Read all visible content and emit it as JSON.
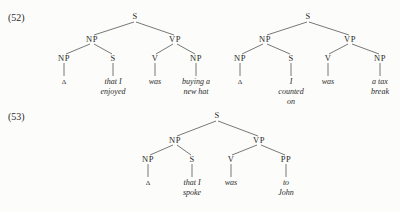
{
  "examples": [
    {
      "number": "(52)",
      "trees": [
        {
          "root": "S",
          "np": "NP",
          "vp": "VP",
          "np_child": "NP",
          "s_child": "S",
          "v": "V",
          "vp_comp": "NP",
          "leaves": {
            "np_child": [
              "Δ"
            ],
            "s_child": [
              "that I",
              "enjoyed"
            ],
            "v": [
              "was"
            ],
            "vp_comp": [
              "buying a",
              "new hat"
            ]
          }
        },
        {
          "root": "S",
          "np": "NP",
          "vp": "VP",
          "np_child": "NP",
          "s_child": "S",
          "v": "V",
          "vp_comp": "NP",
          "leaves": {
            "np_child": [
              "Δ"
            ],
            "s_child": [
              "I",
              "counted",
              "on"
            ],
            "v": [
              "was"
            ],
            "vp_comp": [
              "a tax",
              "break"
            ]
          }
        }
      ]
    },
    {
      "number": "(53)",
      "trees": [
        {
          "root": "S",
          "np": "NP",
          "vp": "VP",
          "np_child": "NP",
          "s_child": "S",
          "v": "V",
          "vp_comp": "PP",
          "leaves": {
            "np_child": [
              "Δ"
            ],
            "s_child": [
              "that I",
              "spoke"
            ],
            "v": [
              "was"
            ],
            "vp_comp": [
              "to",
              "John"
            ]
          }
        }
      ]
    }
  ]
}
